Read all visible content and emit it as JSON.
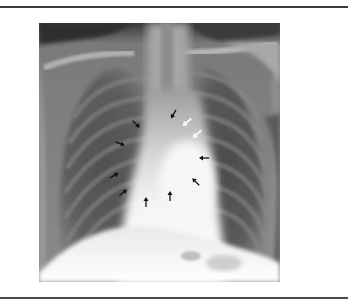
{
  "figure": {
    "type": "radiograph",
    "description": "Posteroanterior chest X-ray with arrows outlining a mediastinal/cardiac contour",
    "arrows": [
      {
        "id": "a1",
        "color": "black",
        "x": 137,
        "y": 125,
        "direction": "down-right"
      },
      {
        "id": "a2",
        "color": "black",
        "x": 173,
        "y": 115,
        "direction": "down-left"
      },
      {
        "id": "a3",
        "color": "white",
        "x": 186,
        "y": 123,
        "direction": "down-left"
      },
      {
        "id": "a4",
        "color": "white",
        "x": 196,
        "y": 135,
        "direction": "down-left"
      },
      {
        "id": "a5",
        "color": "black",
        "x": 121,
        "y": 144,
        "direction": "right"
      },
      {
        "id": "a6",
        "color": "black",
        "x": 203,
        "y": 158,
        "direction": "left"
      },
      {
        "id": "a7",
        "color": "black",
        "x": 115,
        "y": 175,
        "direction": "up-right"
      },
      {
        "id": "a8",
        "color": "black",
        "x": 195,
        "y": 181,
        "direction": "up-left"
      },
      {
        "id": "a9",
        "color": "black",
        "x": 124,
        "y": 192,
        "direction": "up-right"
      },
      {
        "id": "a10",
        "color": "black",
        "x": 146,
        "y": 201,
        "direction": "up"
      },
      {
        "id": "a11",
        "color": "black",
        "x": 170,
        "y": 195,
        "direction": "up"
      }
    ]
  },
  "colors": {
    "rule": "#3a3a3a",
    "background": "#ffffff",
    "lung_dark": "#4a4a4a",
    "mediastinum_bright": "#f2f2f2"
  }
}
